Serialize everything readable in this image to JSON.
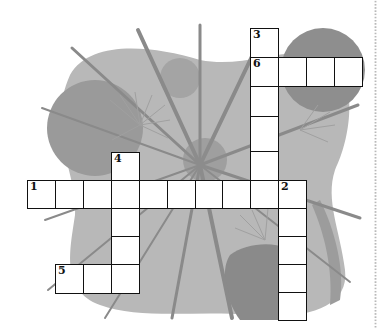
{
  "puzzle": {
    "type": "crossword",
    "cell_size_px": 28,
    "clue_numbers": [
      "1",
      "2",
      "3",
      "4",
      "5",
      "6"
    ],
    "words": [
      {
        "number": "1",
        "direction": "across",
        "length": 10
      },
      {
        "number": "2",
        "direction": "down",
        "length": 5
      },
      {
        "number": "3",
        "direction": "down",
        "length": 6
      },
      {
        "number": "4",
        "direction": "down",
        "length": 5
      },
      {
        "number": "5",
        "direction": "across",
        "length": 3
      },
      {
        "number": "6",
        "direction": "across",
        "length": 4
      }
    ]
  },
  "colors": {
    "background": "#ffffff",
    "grid_line": "#111111",
    "cell_fill": "#ffffff",
    "art_light": "#b5b5b5",
    "art_mid": "#9a9a9a",
    "art_dark": "#858585",
    "divider_dots": "#b9b9b9"
  }
}
